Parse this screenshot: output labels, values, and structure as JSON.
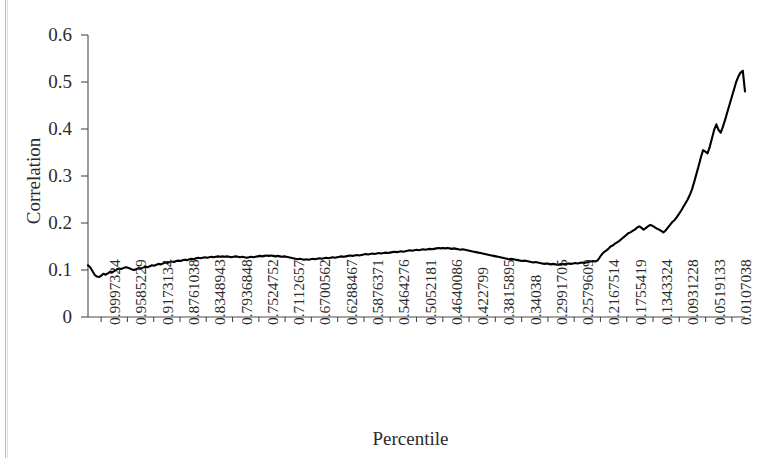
{
  "chart_data": {
    "type": "line",
    "title": "",
    "xlabel": "Percentile",
    "ylabel": "Correlation",
    "ylim": [
      0,
      0.6
    ],
    "yticks": [
      "0",
      "0.1",
      "0.2",
      "0.3",
      "0.4",
      "0.5",
      "0.6"
    ],
    "ytick_values": [
      0,
      0.1,
      0.2,
      0.3,
      0.4,
      0.5,
      0.6
    ],
    "grid": false,
    "legend": null,
    "xtick_labels": [
      "0.9997324",
      "0.9585229",
      "0.9173134",
      "0.8761038",
      "0.8348943",
      "0.7936848",
      "0.7524752",
      "0.7112657",
      "0.6700562",
      "0.6288467",
      "0.5876371",
      "0.5464276",
      "0.5052181",
      "0.4640086",
      "0.422799",
      "0.3815895",
      "0.34038",
      "0.2991705",
      "0.2579609",
      "0.2167514",
      "0.1755419",
      "0.1343324",
      "0.0931228",
      "0.0519133",
      "0.0107038"
    ],
    "series": [
      {
        "name": "Correlation",
        "color": "#000000",
        "values": [
          0.11,
          0.106,
          0.098,
          0.09,
          0.086,
          0.085,
          0.088,
          0.092,
          0.09,
          0.093,
          0.096,
          0.095,
          0.098,
          0.101,
          0.103,
          0.102,
          0.104,
          0.106,
          0.105,
          0.103,
          0.101,
          0.1,
          0.102,
          0.104,
          0.103,
          0.105,
          0.107,
          0.106,
          0.108,
          0.11,
          0.109,
          0.111,
          0.113,
          0.112,
          0.114,
          0.116,
          0.115,
          0.117,
          0.118,
          0.117,
          0.119,
          0.12,
          0.119,
          0.121,
          0.122,
          0.121,
          0.123,
          0.124,
          0.123,
          0.125,
          0.126,
          0.125,
          0.126,
          0.127,
          0.126,
          0.127,
          0.128,
          0.127,
          0.128,
          0.129,
          0.128,
          0.129,
          0.128,
          0.129,
          0.128,
          0.127,
          0.128,
          0.129,
          0.128,
          0.127,
          0.128,
          0.127,
          0.126,
          0.127,
          0.128,
          0.127,
          0.128,
          0.129,
          0.13,
          0.129,
          0.13,
          0.131,
          0.13,
          0.131,
          0.13,
          0.129,
          0.13,
          0.129,
          0.128,
          0.129,
          0.128,
          0.127,
          0.126,
          0.125,
          0.124,
          0.123,
          0.124,
          0.123,
          0.122,
          0.123,
          0.122,
          0.123,
          0.124,
          0.123,
          0.124,
          0.125,
          0.124,
          0.125,
          0.126,
          0.125,
          0.126,
          0.127,
          0.126,
          0.127,
          0.128,
          0.129,
          0.128,
          0.129,
          0.13,
          0.131,
          0.13,
          0.131,
          0.132,
          0.131,
          0.132,
          0.133,
          0.134,
          0.133,
          0.134,
          0.135,
          0.134,
          0.135,
          0.136,
          0.135,
          0.136,
          0.137,
          0.136,
          0.137,
          0.138,
          0.139,
          0.138,
          0.139,
          0.14,
          0.139,
          0.14,
          0.141,
          0.142,
          0.141,
          0.142,
          0.143,
          0.142,
          0.143,
          0.144,
          0.143,
          0.144,
          0.145,
          0.144,
          0.145,
          0.146,
          0.147,
          0.146,
          0.147,
          0.146,
          0.147,
          0.146,
          0.145,
          0.146,
          0.145,
          0.144,
          0.143,
          0.144,
          0.143,
          0.142,
          0.141,
          0.14,
          0.139,
          0.138,
          0.137,
          0.136,
          0.135,
          0.134,
          0.133,
          0.132,
          0.131,
          0.13,
          0.129,
          0.128,
          0.127,
          0.126,
          0.125,
          0.124,
          0.123,
          0.124,
          0.123,
          0.122,
          0.121,
          0.12,
          0.119,
          0.12,
          0.119,
          0.118,
          0.117,
          0.116,
          0.117,
          0.116,
          0.115,
          0.114,
          0.113,
          0.114,
          0.113,
          0.112,
          0.113,
          0.112,
          0.111,
          0.112,
          0.113,
          0.112,
          0.113,
          0.114,
          0.113,
          0.114,
          0.115,
          0.114,
          0.115,
          0.116,
          0.115,
          0.116,
          0.117,
          0.118,
          0.119,
          0.118,
          0.12,
          0.126,
          0.133,
          0.138,
          0.141,
          0.145,
          0.15,
          0.152,
          0.156,
          0.159,
          0.162,
          0.166,
          0.17,
          0.174,
          0.178,
          0.18,
          0.183,
          0.186,
          0.19,
          0.193,
          0.19,
          0.186,
          0.189,
          0.193,
          0.196,
          0.194,
          0.191,
          0.188,
          0.186,
          0.183,
          0.18,
          0.184,
          0.19,
          0.196,
          0.202,
          0.206,
          0.212,
          0.219,
          0.226,
          0.234,
          0.242,
          0.25,
          0.26,
          0.272,
          0.288,
          0.305,
          0.322,
          0.34,
          0.355,
          0.352,
          0.348,
          0.362,
          0.38,
          0.398,
          0.41,
          0.398,
          0.392,
          0.405,
          0.42,
          0.436,
          0.452,
          0.468,
          0.484,
          0.5,
          0.512,
          0.52,
          0.524,
          0.48
        ]
      }
    ]
  }
}
